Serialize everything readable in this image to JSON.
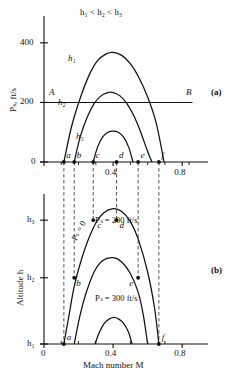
{
  "figure": {
    "title_top": "h₁ < h₂ < h₃",
    "panel_a_label": "(a)",
    "panel_b_label": "(b)"
  },
  "chart_data": [
    {
      "type": "line",
      "panel": "a",
      "title": "h₁ < h₂ < h₃",
      "xlabel": "",
      "ylabel": "Pₛ, ft/s",
      "xlim": [
        0,
        0.88
      ],
      "ylim": [
        0,
        470
      ],
      "grid": false,
      "legend": "inline-curve-labels",
      "xticks": [
        0,
        0.4,
        0.8
      ],
      "xtick_labels": [
        "0",
        "0.4",
        "0.8"
      ],
      "xminor": [
        0.1,
        0.2,
        0.3,
        0.5,
        0.6,
        0.7
      ],
      "yticks": [
        0,
        200,
        400
      ],
      "ytick_labels": [
        "0",
        "200",
        "400"
      ],
      "series": [
        {
          "name": "h₁",
          "label": "h₁",
          "x": [
            0.115,
            0.16,
            0.21,
            0.26,
            0.31,
            0.36,
            0.4,
            0.45,
            0.5,
            0.55,
            0.6,
            0.65,
            0.695
          ],
          "y": [
            0,
            120,
            215,
            290,
            340,
            363,
            368,
            358,
            330,
            283,
            218,
            130,
            0
          ]
        },
        {
          "name": "h₂",
          "label": "h₂",
          "x": [
            0.175,
            0.21,
            0.25,
            0.29,
            0.33,
            0.37,
            0.4,
            0.44,
            0.48,
            0.52,
            0.56,
            0.6,
            0.625
          ],
          "y": [
            0,
            85,
            150,
            196,
            222,
            233,
            233,
            222,
            196,
            155,
            100,
            35,
            0
          ]
        },
        {
          "name": "h₃",
          "label": "h₃",
          "x": [
            0.285,
            0.31,
            0.34,
            0.37,
            0.4,
            0.43,
            0.46,
            0.49,
            0.515
          ],
          "y": [
            0,
            50,
            84,
            100,
            104,
            100,
            84,
            50,
            0
          ]
        }
      ],
      "annotations": [
        {
          "name": "constant-power-line",
          "label_left": "A",
          "label_right": "B",
          "y_value": 200,
          "x_from": 0.02,
          "x_to": 0.86,
          "note": "horizontal line P_s = 200 ft/s"
        },
        {
          "name": "point",
          "label": "a",
          "x": 0.115,
          "y": 0
        },
        {
          "name": "point",
          "label": "b",
          "x": 0.175,
          "y": 0
        },
        {
          "name": "point",
          "label": "c",
          "x": 0.285,
          "y": 0
        },
        {
          "name": "point",
          "label": "d",
          "x": 0.42,
          "y": 0
        },
        {
          "name": "point",
          "label": "e",
          "x": 0.545,
          "y": 0
        },
        {
          "name": "point",
          "label": "f",
          "x": 0.665,
          "y": 0
        }
      ]
    },
    {
      "type": "line",
      "panel": "b",
      "title": "",
      "xlabel": "Mach number M",
      "ylabel": "Altitude h",
      "xlim": [
        0,
        0.88
      ],
      "ylim": [
        0,
        1
      ],
      "grid": false,
      "xticks": [
        0,
        0.4,
        0.8
      ],
      "xtick_labels": [
        "0",
        "0.4",
        "0.8"
      ],
      "xminor": [
        0.1,
        0.2,
        0.3,
        0.5,
        0.6,
        0.7
      ],
      "yticks": [
        0.0,
        0.46,
        0.86
      ],
      "ytick_labels": [
        "h₁",
        "h₂",
        "h₃"
      ],
      "series": [
        {
          "name": "Ps = 0",
          "label": "Pₛ = 0",
          "x": [
            0.115,
            0.145,
            0.175,
            0.215,
            0.255,
            0.3,
            0.345,
            0.4,
            0.45,
            0.5,
            0.545,
            0.6,
            0.64,
            0.665
          ],
          "y": [
            0.0,
            0.2,
            0.4,
            0.58,
            0.72,
            0.84,
            0.91,
            0.94,
            0.92,
            0.85,
            0.73,
            0.5,
            0.25,
            0.0
          ]
        },
        {
          "name": "Ps = 200 ft/s",
          "label": "Pₛ = 200 ft/s",
          "x": [
            0.175,
            0.205,
            0.24,
            0.29,
            0.34,
            0.4,
            0.45,
            0.5,
            0.545,
            0.575,
            0.6
          ],
          "y": [
            0.0,
            0.18,
            0.34,
            0.5,
            0.58,
            0.6,
            0.57,
            0.49,
            0.36,
            0.2,
            0.0
          ]
        },
        {
          "name": "Ps = 300 ft/s",
          "label": "Pₛ = 300 ft/s",
          "x": [
            0.295,
            0.32,
            0.35,
            0.38,
            0.405,
            0.43,
            0.46,
            0.49,
            0.51
          ],
          "y": [
            0.0,
            0.08,
            0.145,
            0.175,
            0.185,
            0.175,
            0.145,
            0.08,
            0.0
          ]
        }
      ],
      "annotations": [
        {
          "name": "point",
          "label": "a",
          "x": 0.115,
          "y": 0.0
        },
        {
          "name": "point",
          "label": "b",
          "x": 0.175,
          "y": 0.46
        },
        {
          "name": "point",
          "label": "c",
          "x": 0.285,
          "y": 0.86
        },
        {
          "name": "point",
          "label": "d",
          "x": 0.42,
          "y": 0.86
        },
        {
          "name": "point",
          "label": "e",
          "x": 0.545,
          "y": 0.46
        },
        {
          "name": "point",
          "label": "f",
          "x": 0.665,
          "y": 0.0
        }
      ]
    }
  ],
  "connectors": {
    "note": "dashed vertical lines linking points a–f between panel (a) and panel (b)",
    "x_values": [
      0.115,
      0.175,
      0.285,
      0.42,
      0.545,
      0.665
    ],
    "labels": [
      "a",
      "b",
      "c",
      "d",
      "e",
      "f"
    ]
  },
  "colors": {
    "ink": "#111111",
    "background": "#ffffff",
    "dash": "#555555"
  }
}
